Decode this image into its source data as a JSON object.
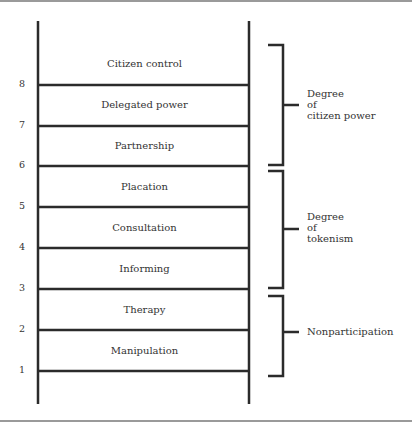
{
  "rungs": [
    {
      "number": "8",
      "label": "Citizen control"
    },
    {
      "number": "7",
      "label": "Delegated power"
    },
    {
      "number": "6",
      "label": "Partnership"
    },
    {
      "number": "5",
      "label": "Placation"
    },
    {
      "number": "4",
      "label": "Consultation"
    },
    {
      "number": "3",
      "label": "Informing"
    },
    {
      "number": "2",
      "label": "Therapy"
    },
    {
      "number": "1",
      "label": "Manipulation"
    }
  ],
  "groups": [
    {
      "label": "Degree\nof\ncitizen power",
      "rungs": [
        "8",
        "7",
        "6"
      ]
    },
    {
      "label": "Degree\nof\ntokenism",
      "rungs": [
        "5",
        "4",
        "3"
      ]
    },
    {
      "label": "Nonparticipation",
      "rungs": [
        "2",
        "1"
      ]
    }
  ]
}
